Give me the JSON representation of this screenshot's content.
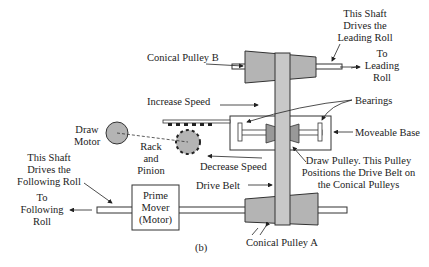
{
  "diagram": {
    "caption": "(b)",
    "labels": {
      "conical_pulley_b": "Conical Pulley B",
      "conical_pulley_a": "Conical Pulley A",
      "leading_shaft": [
        "This Shaft",
        "Drives the",
        "Leading Roll"
      ],
      "to_leading_roll": [
        "To",
        "Leading",
        "Roll"
      ],
      "increase_speed": "Increase Speed",
      "decrease_speed": "Decrease Speed",
      "bearings": "Bearings",
      "moveable_base": "Moveable Base",
      "draw_motor": [
        "Draw",
        "Motor"
      ],
      "rack_and_pinion": [
        "Rack",
        "and",
        "Pinion"
      ],
      "draw_pulley": [
        "Draw Pulley. This Pulley",
        "Positions the Drive Belt on",
        "the Conical Pulleys"
      ],
      "following_shaft": [
        "This Shaft",
        "Drives the",
        "Following Roll"
      ],
      "to_following_roll": [
        "To",
        "Following",
        "Roll"
      ],
      "drive_belt": "Drive Belt",
      "prime_mover": [
        "Prime",
        "Mover",
        "(Motor)"
      ]
    },
    "colors": {
      "fill_gray": "#b4b4b4",
      "stroke": "#333333",
      "belt": "#c8c8c8"
    }
  }
}
